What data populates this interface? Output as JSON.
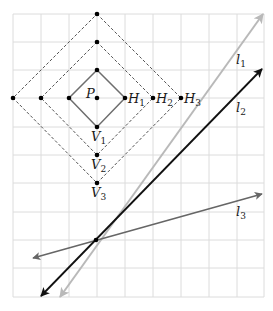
{
  "diagram": {
    "type": "geometry-grid",
    "grid": {
      "x0": 13,
      "y0": 14,
      "cols": 9,
      "rows": 10,
      "cell_w": 27.9,
      "cell_h": 28.3,
      "color": "#d9d9d9"
    },
    "point_P": {
      "label": "P",
      "x": 97,
      "y": 98
    },
    "diamonds": [
      {
        "name": "diamond-1",
        "radius": 84,
        "style": "solid",
        "color": "#6e6e6e",
        "scale_x": 28,
        "scale_y": 28.3
      },
      {
        "name": "diamond-2",
        "style": "dashed",
        "color": "#555555"
      },
      {
        "name": "diamond-3",
        "style": "dashed",
        "color": "#555555"
      }
    ],
    "vertices": [
      {
        "x": 97,
        "y": 70
      },
      {
        "x": 69,
        "y": 98
      },
      {
        "x": 125,
        "y": 98
      },
      {
        "x": 97,
        "y": 127
      },
      {
        "x": 97,
        "y": 42
      },
      {
        "x": 41,
        "y": 98
      },
      {
        "x": 153,
        "y": 98
      },
      {
        "x": 97,
        "y": 155
      },
      {
        "x": 97,
        "y": 14
      },
      {
        "x": 13,
        "y": 98
      },
      {
        "x": 181,
        "y": 98
      },
      {
        "x": 97,
        "y": 183
      }
    ],
    "labels": {
      "P": {
        "main": "P",
        "sub": ""
      },
      "H1": {
        "main": "H",
        "sub": "1"
      },
      "H2": {
        "main": "H",
        "sub": "2"
      },
      "H3": {
        "main": "H",
        "sub": "3"
      },
      "V1": {
        "main": "V",
        "sub": "1"
      },
      "V2": {
        "main": "V",
        "sub": "2"
      },
      "V3": {
        "main": "V",
        "sub": "3"
      },
      "l1": {
        "main": "l",
        "sub": "1"
      },
      "l2": {
        "main": "l",
        "sub": "2"
      },
      "l3": {
        "main": "l",
        "sub": "3"
      }
    },
    "lines": [
      {
        "name": "l1",
        "color": "#b9b9b9",
        "from": [
          60,
          297
        ],
        "to": [
          263,
          14
        ]
      },
      {
        "name": "l2",
        "color": "#111111",
        "from": [
          41,
          296
        ],
        "to": [
          262,
          69
        ]
      },
      {
        "name": "l3",
        "color": "#666666",
        "from": [
          33,
          258
        ],
        "to": [
          262,
          194
        ]
      }
    ],
    "intersection": {
      "x": 96,
      "y": 240
    }
  }
}
